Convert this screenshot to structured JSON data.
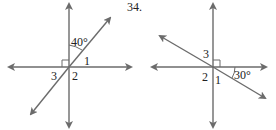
{
  "problem_number": "34.",
  "left_figure": {
    "angle_given": "40°",
    "labels": [
      "1",
      "2",
      "3"
    ],
    "right_angle_marker": true
  },
  "right_figure": {
    "angle_given": "30°",
    "labels": [
      "1",
      "2",
      "3"
    ],
    "right_angle_marker": true
  },
  "colors": {
    "line": "#6b6b6b",
    "text": "#222222"
  }
}
